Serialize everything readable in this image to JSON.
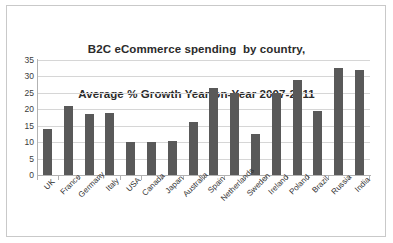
{
  "chart_data": {
    "type": "bar",
    "title": "B2C eCommerce spending  by country,\nAverage % Growth Year-on-Year 2007-2011",
    "title_lines": [
      "B2C eCommerce spending  by country,",
      "Average % Growth Year-on-Year 2007-2011"
    ],
    "xlabel": "",
    "ylabel": "",
    "ylim": [
      0,
      35
    ],
    "yticks": [
      0,
      5,
      10,
      15,
      20,
      25,
      30,
      35
    ],
    "ytick_labels": [
      "0",
      "5",
      "10",
      "15",
      "20",
      "25",
      "30",
      "35"
    ],
    "grid": true,
    "legend": false,
    "bar_color": "#595959",
    "categories": [
      "UK",
      "France",
      "Germany",
      "Italy",
      "USA",
      "Canada",
      "Japan",
      "Australia",
      "Spain",
      "Netherlands",
      "Sweden",
      "Ireland",
      "Poland",
      "Brazil",
      "Russia",
      "India"
    ],
    "values": [
      14,
      21,
      18.5,
      19,
      10,
      10,
      10.5,
      16,
      26.5,
      25,
      12.5,
      25,
      29,
      19.5,
      32.5,
      32
    ]
  }
}
